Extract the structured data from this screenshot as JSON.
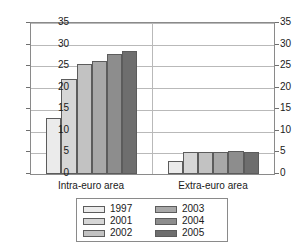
{
  "chart_data": {
    "type": "bar",
    "title": "",
    "subtitle": "",
    "xlabel": "",
    "ylabel": "",
    "categories": [
      "Intra-euro area",
      "Extra-euro area"
    ],
    "series": [
      {
        "name": "1997",
        "color": "#ebebeb",
        "values": [
          13.0,
          3.0
        ]
      },
      {
        "name": "2001",
        "color": "#d6d6d6",
        "values": [
          22.0,
          5.0
        ]
      },
      {
        "name": "2002",
        "color": "#c2c2c2",
        "values": [
          25.5,
          5.1
        ]
      },
      {
        "name": "2003",
        "color": "#a8a8a8",
        "values": [
          26.2,
          5.0
        ]
      },
      {
        "name": "2004",
        "color": "#8d8d8d",
        "values": [
          27.9,
          5.3
        ]
      },
      {
        "name": "2005",
        "color": "#6e6e6e",
        "values": [
          28.4,
          5.1
        ]
      }
    ],
    "ylim": [
      0,
      35
    ],
    "yticks": [
      0,
      5,
      10,
      15,
      20,
      25,
      30,
      35
    ],
    "ytick_labels": [
      "0",
      "5",
      "10",
      "15",
      "20",
      "25",
      "30",
      "35"
    ],
    "right_axis": true,
    "right_ytick_labels": [
      "0",
      "5",
      "10",
      "15",
      "20",
      "25",
      "30",
      "35"
    ],
    "grid": true,
    "legend_position": "bottom",
    "legend_entries": [
      "1997",
      "2001",
      "2002",
      "2003",
      "2004",
      "2005"
    ]
  }
}
